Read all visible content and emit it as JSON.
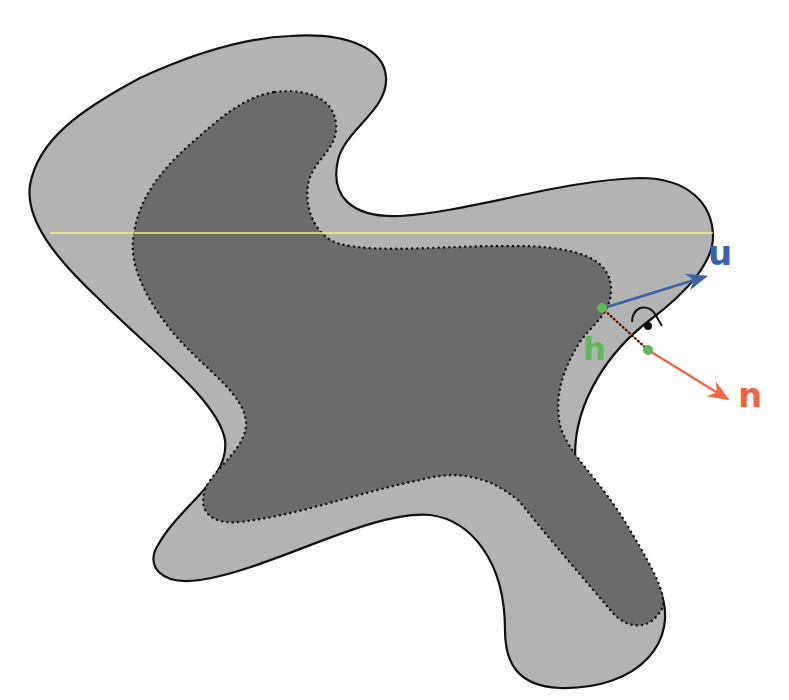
{
  "diagram": {
    "colors": {
      "background": "#ffffff",
      "outer_fill": "#b3b3b3",
      "inner_fill": "#6b6b6b",
      "outline": "#111111",
      "guide_line": "#f2f27a",
      "u_vector": "#3a64a6",
      "n_vector": "#f06542",
      "h_segment": "#5fb95a"
    },
    "labels": {
      "u": "u",
      "n": "n",
      "h": "h"
    },
    "elements": [
      {
        "name": "outer-shape",
        "style": "solid outline, light gray fill"
      },
      {
        "name": "inner-shape",
        "style": "dotted outline, dark gray fill"
      },
      {
        "name": "horizontal-guide-line",
        "color": "yellow"
      },
      {
        "name": "u-vector",
        "label": "u",
        "color": "blue"
      },
      {
        "name": "n-vector",
        "label": "n",
        "color": "orange"
      },
      {
        "name": "h-segment",
        "label": "h",
        "color": "green"
      },
      {
        "name": "right-angle-marker"
      }
    ]
  }
}
